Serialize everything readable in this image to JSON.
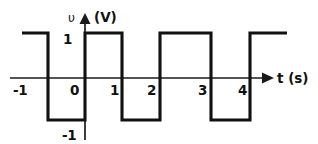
{
  "figure": {
    "axes": {
      "y_symbol": "υ",
      "y_unit_label": "(V)",
      "x_label": "t (s)",
      "y_tick_top": "1",
      "y_tick_bottom": "-1",
      "x_ticks": [
        "-1",
        "0",
        "1",
        "2",
        "3",
        "4"
      ]
    },
    "ink_color": "#111111",
    "background_color": "#ffffff"
  },
  "chart_data": {
    "type": "line",
    "title": "",
    "subtitle": "",
    "xlabel": "t (s)",
    "ylabel": "υ (V)",
    "xlim": [
      -1.7,
      5.0
    ],
    "ylim": [
      -1.45,
      1.45
    ],
    "grid": false,
    "legend": null,
    "waveform": "square",
    "amplitude": 1,
    "period": 2,
    "duty_cycle": 0.5,
    "x_ticks": [
      -1,
      0,
      1,
      2,
      3,
      4
    ],
    "x_tick_labels": [
      "-1",
      "0",
      "1",
      "2",
      "3",
      "4"
    ],
    "y_ticks": [
      -1,
      1
    ],
    "y_tick_labels": [
      "-1",
      "1"
    ],
    "segments": [
      {
        "x_start": -1.7,
        "x_end": -1,
        "value": 1
      },
      {
        "x_start": -1,
        "x_end": 0,
        "value": -1
      },
      {
        "x_start": 0,
        "x_end": 1,
        "value": 1
      },
      {
        "x_start": 1,
        "x_end": 2,
        "value": -1
      },
      {
        "x_start": 2,
        "x_end": 3,
        "value": 1
      },
      {
        "x_start": 3,
        "x_end": 4,
        "value": -1
      },
      {
        "x_start": 4,
        "x_end": 5,
        "value": 1
      }
    ],
    "x": [
      -1.7,
      -1,
      -1,
      0,
      0,
      1,
      1,
      2,
      2,
      3,
      3,
      4,
      4,
      5
    ],
    "values": [
      1,
      1,
      -1,
      -1,
      1,
      1,
      -1,
      -1,
      1,
      1,
      -1,
      -1,
      1,
      1
    ]
  },
  "geometry": {
    "axis_y_px": 78,
    "axis_x_px": 85,
    "high_y_px": 33,
    "low_y_px": 120,
    "wave_path": "M 22 33 L 48 33 L 48 120 L 85 120 L 85 33 L 122 33 L 122 120 L 160 120 L 160 33 L 211 33 L 211 120 L 250 120 L 250 33 L 287 33",
    "x_axis_path": "M 10 78 L 262 78",
    "y_axis_path": "M 85 140 L 85 21",
    "x_arrow_points": "262,72.5 274,78 262,83.5",
    "y_arrow_points": "79.5,24 85,13 90.5,24"
  },
  "labels": {
    "y_symbol": {
      "text": "υ",
      "x": 68,
      "y": 22
    },
    "y_unit": {
      "text": "(V)",
      "x": 94,
      "y": 22
    },
    "y_top": {
      "text": "1",
      "x": 63,
      "y": 44
    },
    "y_bottom": {
      "text": "-1",
      "x": 62,
      "y": 140
    },
    "x_axis_title": {
      "text": "t (s)",
      "x": 277,
      "y": 83
    },
    "tick_minus1": {
      "text": "-1",
      "x": 13,
      "y": 95
    },
    "tick_0": {
      "text": "0",
      "x": 70,
      "y": 95
    },
    "tick_1": {
      "text": "1",
      "x": 110,
      "y": 95
    },
    "tick_2": {
      "text": "2",
      "x": 147,
      "y": 95
    },
    "tick_3": {
      "text": "3",
      "x": 198,
      "y": 95
    },
    "tick_4": {
      "text": "4",
      "x": 238,
      "y": 95
    }
  }
}
